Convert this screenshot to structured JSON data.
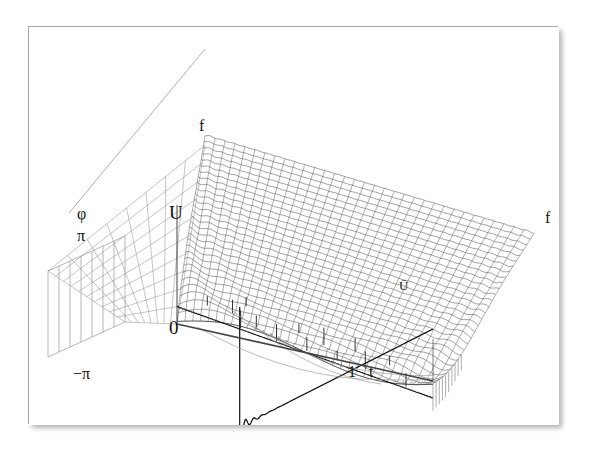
{
  "figure": {
    "title": "",
    "background_color": "#ffffff",
    "frame_color": "#a9a9a9",
    "mesh_color": "#555555",
    "curve_color": "#111111",
    "accent_color": "#888888"
  },
  "axes": {
    "vertical_label": "U",
    "origin_label": "0",
    "time_label": "t",
    "time_tick_label": "1",
    "frequency_label_top": "f",
    "frequency_label_right": "f",
    "phase_label": "φ",
    "phase_max_label": "π",
    "phase_min_label": "−π",
    "mean_label": "Ū"
  },
  "chart_data": {
    "type": "surface",
    "title": "",
    "xlabel": "t",
    "ylabel": "f",
    "zlabel": "U",
    "secondary_axis_label": "φ",
    "xlim": [
      0,
      1.35
    ],
    "ylim": [
      0,
      1
    ],
    "zlim": [
      -1.2,
      1.2
    ],
    "philim": [
      -3.14159,
      3.14159
    ],
    "grid": true,
    "legend": false,
    "annotations": [
      {
        "text": "f",
        "role": "frequency-axis-apex"
      },
      {
        "text": "f",
        "role": "frequency-axis-right"
      },
      {
        "text": "U",
        "role": "amplitude-axis"
      },
      {
        "text": "0",
        "role": "origin"
      },
      {
        "text": "1",
        "role": "time-tick"
      },
      {
        "text": "t",
        "role": "time-axis"
      },
      {
        "text": "Ū",
        "role": "mean-value-marker"
      },
      {
        "text": "φ",
        "role": "phase-axis"
      },
      {
        "text": "π",
        "role": "phase-upper-bound"
      },
      {
        "text": "−π",
        "role": "phase-lower-bound"
      }
    ],
    "surface": {
      "n_time_lines": 34,
      "n_freq_lines": 30,
      "waveform": "sawtooth partial sums",
      "harmonics_max": 30
    },
    "front_curve": {
      "name": "limit waveform at f = max",
      "feature": "discontinuity with Gibbs overshoot",
      "overshoot_percent": 9
    },
    "tick_marks": {
      "count": 14,
      "orientation": "vertical stems on surface"
    }
  }
}
